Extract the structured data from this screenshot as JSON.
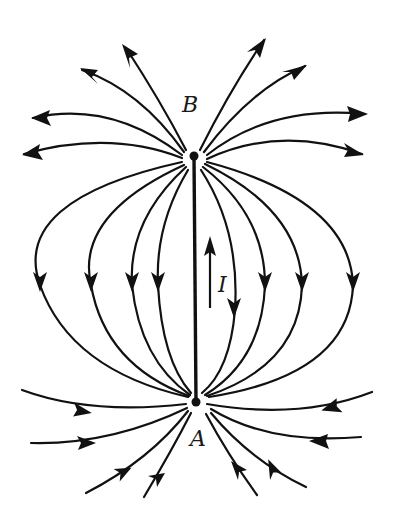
{
  "figure": {
    "labels": {
      "top_point": "B",
      "bottom_point": "A",
      "current": "I"
    },
    "points": {
      "B": {
        "x": 194,
        "y": 156
      },
      "A": {
        "x": 196,
        "y": 402
      }
    },
    "current_direction": "up (from A to B)",
    "colors": {
      "line": "#111111",
      "background": "#ffffff"
    }
  }
}
